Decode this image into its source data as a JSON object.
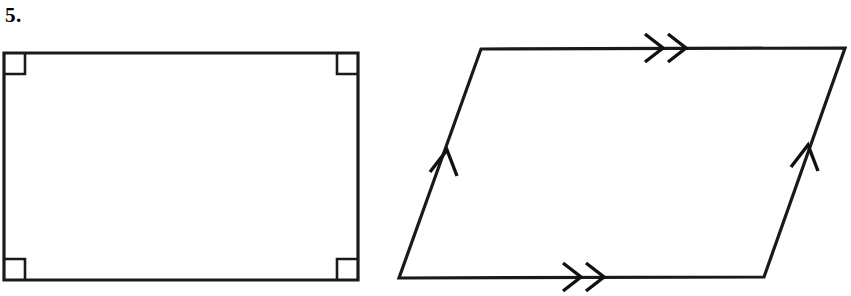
{
  "page": {
    "background_color": "#ffffff",
    "stroke_color": "#1a1a1a",
    "width": 851,
    "height": 296
  },
  "problem": {
    "number_label": "5."
  },
  "figures": [
    {
      "id": "rectangle",
      "name": "rectangle-figure",
      "shape_type": "rectangle",
      "description": "Rectangle with right angle marks at all four corners",
      "vertices": [
        {
          "name": "top-left",
          "x": 4,
          "y": 53
        },
        {
          "name": "top-right",
          "x": 358,
          "y": 53
        },
        {
          "name": "bottom-right",
          "x": 358,
          "y": 280
        },
        {
          "name": "bottom-left",
          "x": 4,
          "y": 280
        }
      ],
      "marks": [
        {
          "type": "right-angle",
          "corner": "top-left",
          "size": 21
        },
        {
          "type": "right-angle",
          "corner": "top-right",
          "size": 21
        },
        {
          "type": "right-angle",
          "corner": "bottom-right",
          "size": 21
        },
        {
          "type": "right-angle",
          "corner": "bottom-left",
          "size": 21
        }
      ]
    },
    {
      "id": "parallelogram",
      "name": "parallelogram-figure",
      "shape_type": "parallelogram",
      "description": "Parallelogram with double chevron marks on horizontal sides and single chevron marks on slanted sides",
      "vertices": [
        {
          "name": "top-left",
          "x": 481,
          "y": 49
        },
        {
          "name": "top-right",
          "x": 845,
          "y": 48
        },
        {
          "name": "bottom-right",
          "x": 764,
          "y": 277
        },
        {
          "name": "bottom-left",
          "x": 399,
          "y": 278
        }
      ],
      "marks": [
        {
          "type": "chevron",
          "edge": "top",
          "count": 2,
          "direction": "right",
          "x": 663,
          "y": 48
        },
        {
          "type": "chevron",
          "edge": "bottom",
          "count": 2,
          "direction": "right",
          "x": 581,
          "y": 277
        },
        {
          "type": "chevron",
          "edge": "left",
          "count": 1,
          "direction": "up-right",
          "x": 447,
          "y": 156
        },
        {
          "type": "chevron",
          "edge": "right",
          "count": 1,
          "direction": "up-right",
          "x": 808,
          "y": 151
        }
      ]
    }
  ]
}
